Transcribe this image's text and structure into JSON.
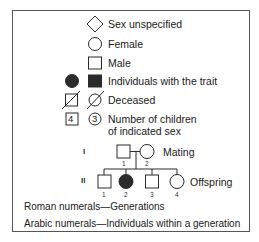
{
  "legend": {
    "items": [
      {
        "symbol": "diamond",
        "label": "Sex unspecified"
      },
      {
        "symbol": "circle",
        "label": "Female"
      },
      {
        "symbol": "square",
        "label": "Male"
      },
      {
        "symbol": "filled-circle-and-square",
        "label": "Individuals with the trait"
      },
      {
        "symbol": "slashed-square-and-circle",
        "label": "Deceased"
      },
      {
        "symbol": "numbered-square-and-circle",
        "label_line1": "Number of children",
        "label_line2": "of indicated sex",
        "square_number": "4",
        "circle_number": "3"
      }
    ]
  },
  "pedigree": {
    "generations": [
      {
        "numeral": "I",
        "label": "Mating",
        "individuals": [
          {
            "number": "1",
            "sex": "male",
            "affected": false
          },
          {
            "number": "2",
            "sex": "female",
            "affected": false
          }
        ]
      },
      {
        "numeral": "II",
        "label": "Offspring",
        "individuals": [
          {
            "number": "1",
            "sex": "male",
            "affected": false
          },
          {
            "number": "2",
            "sex": "female",
            "affected": true
          },
          {
            "number": "3",
            "sex": "male",
            "affected": false
          },
          {
            "number": "4",
            "sex": "female",
            "affected": false
          }
        ]
      }
    ]
  },
  "notes": {
    "roman": "Roman numerals—Generations",
    "arabic": "Arabic numerals—Individuals within a generation"
  },
  "colors": {
    "stroke": "#2a2a2a",
    "fill_affected": "#2b2b2b",
    "border": "#555555"
  }
}
